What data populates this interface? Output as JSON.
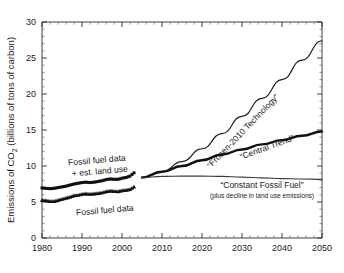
{
  "chart_data": {
    "type": "line",
    "title": "",
    "xlabel": "",
    "ylabel": "Emissions of CO2 (billions of tons of carbon)",
    "ylabel_parts": {
      "pre": "Emissions of CO",
      "sub": "2",
      "post": " (billions of tons of carbon)"
    },
    "xlim": [
      1980,
      2050
    ],
    "ylim": [
      0,
      30
    ],
    "xticks": [
      "1980",
      "1990",
      "2000",
      "2010",
      "2020",
      "2030",
      "2040",
      "2050"
    ],
    "xtick_values": [
      1980,
      1990,
      2000,
      2010,
      2020,
      2030,
      2040,
      2050
    ],
    "yticks": [
      "0",
      "5",
      "10",
      "15",
      "20",
      "25",
      "30"
    ],
    "ytick_values": [
      0,
      5,
      10,
      15,
      20,
      25,
      30
    ],
    "grid": false,
    "legend_position": "inline-annotations",
    "series": [
      {
        "name": "Fossil fuel data + est. land use",
        "style": "markers",
        "marker": "square",
        "color": "#111111",
        "x": [
          1980,
          1981,
          1982,
          1983,
          1984,
          1985,
          1986,
          1987,
          1988,
          1989,
          1990,
          1991,
          1992,
          1993,
          1994,
          1995,
          1996,
          1997,
          1998,
          1999,
          2000,
          2001,
          2002,
          2003
        ],
        "values": [
          6.95,
          6.9,
          6.85,
          6.9,
          7.0,
          7.1,
          7.2,
          7.35,
          7.5,
          7.6,
          7.7,
          7.75,
          7.7,
          7.75,
          7.85,
          7.95,
          8.1,
          8.2,
          8.15,
          8.15,
          8.3,
          8.4,
          8.6,
          9.05
        ]
      },
      {
        "name": "Fossil fuel data",
        "style": "markers",
        "marker": "triangle",
        "color": "#111111",
        "x": [
          1980,
          1981,
          1982,
          1983,
          1984,
          1985,
          1986,
          1987,
          1988,
          1989,
          1990,
          1991,
          1992,
          1993,
          1994,
          1995,
          1996,
          1997,
          1998,
          1999,
          2000,
          2001,
          2002,
          2003
        ],
        "values": [
          5.25,
          5.2,
          5.1,
          5.1,
          5.25,
          5.4,
          5.55,
          5.7,
          5.9,
          5.95,
          6.1,
          6.15,
          6.1,
          6.15,
          6.2,
          6.3,
          6.45,
          6.55,
          6.5,
          6.45,
          6.6,
          6.65,
          6.75,
          7.1
        ]
      },
      {
        "name": "“Frozen-2010 Technology”",
        "style": "line",
        "weight": "thin",
        "color": "#1a1a1a",
        "x": [
          2005,
          2010,
          2015,
          2020,
          2025,
          2030,
          2035,
          2040,
          2045,
          2050
        ],
        "values": [
          8.4,
          9.2,
          10.6,
          12.4,
          14.5,
          16.9,
          19.4,
          22.0,
          24.7,
          27.4
        ]
      },
      {
        "name": "“Central Trend”",
        "style": "line",
        "weight": "thick",
        "color": "#111111",
        "x": [
          2005,
          2010,
          2015,
          2020,
          2025,
          2030,
          2035,
          2040,
          2045,
          2050
        ],
        "values": [
          8.4,
          9.2,
          10.0,
          10.8,
          11.6,
          12.3,
          13.0,
          13.6,
          14.2,
          14.8
        ]
      },
      {
        "name": "“Constant Fossil Fuel”",
        "style": "line",
        "weight": "thin",
        "color": "#3a3a3a",
        "x": [
          2005,
          2010,
          2015,
          2020,
          2025,
          2030,
          2035,
          2040,
          2045,
          2050
        ],
        "values": [
          8.4,
          8.55,
          8.6,
          8.6,
          8.55,
          8.45,
          8.35,
          8.25,
          8.2,
          8.15
        ]
      }
    ],
    "annotations": [
      {
        "id": "frozen",
        "text": "“Frozen-2010 Technology”",
        "rotated": true
      },
      {
        "id": "central",
        "text": "“Central Trend”",
        "rotated": true
      },
      {
        "id": "constant",
        "text": "“Constant Fossil Fuel”",
        "rotated": false
      },
      {
        "id": "constant_sub",
        "text": "(plus decline in land use emissions)",
        "rotated": false
      },
      {
        "id": "data_upper_line1",
        "text": "Fossil fuel data",
        "rotated": false
      },
      {
        "id": "data_upper_line2",
        "text": "+ est. land use",
        "rotated": false
      },
      {
        "id": "data_lower",
        "text": "Fossil fuel data",
        "rotated": false
      }
    ]
  }
}
